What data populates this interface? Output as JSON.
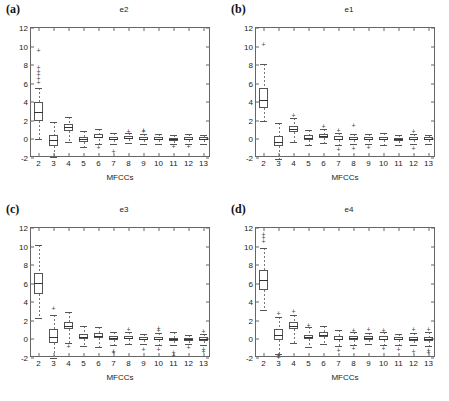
{
  "figure": {
    "xlabel": "MFCCs",
    "yticks": [
      "12",
      "10",
      "8",
      "6",
      "4",
      "2",
      "0",
      "-2"
    ],
    "xticks": [
      "2",
      "3",
      "4",
      "5",
      "6",
      "7",
      "8",
      "9",
      "10",
      "11",
      "12",
      "13"
    ],
    "ylim": [
      -2,
      12
    ],
    "line_color": "#555555",
    "panels": [
      {
        "label": "(a)",
        "title": "e2"
      },
      {
        "label": "(b)",
        "title": "e1"
      },
      {
        "label": "(c)",
        "title": "e3"
      },
      {
        "label": "(d)",
        "title": "e4"
      }
    ]
  },
  "chart_data": [
    {
      "type": "box",
      "title": "e2",
      "panel": "(a)",
      "xlabel": "MFCCs",
      "ylabel": "",
      "ylim": [
        -2,
        12
      ],
      "grid": false,
      "categories": [
        "2",
        "3",
        "4",
        "5",
        "6",
        "7",
        "8",
        "9",
        "10",
        "11",
        "12",
        "13"
      ],
      "boxes": [
        {
          "x": "2",
          "whisker_low": 0.0,
          "q1": 2.0,
          "median": 3.0,
          "q3": 4.0,
          "whisker_high": 5.5,
          "outliers": [
            6.2,
            6.6,
            7.0,
            7.4,
            7.8,
            9.6
          ]
        },
        {
          "x": "3",
          "whisker_low": -1.9,
          "q1": -0.7,
          "median": -0.1,
          "q3": 0.5,
          "whisker_high": 1.9,
          "outliers": []
        },
        {
          "x": "4",
          "whisker_low": -0.3,
          "q1": 0.9,
          "median": 1.3,
          "q3": 1.7,
          "whisker_high": 2.4,
          "outliers": []
        },
        {
          "x": "5",
          "whisker_low": -0.8,
          "q1": -0.3,
          "median": 0.0,
          "q3": 0.3,
          "whisker_high": 0.9,
          "outliers": []
        },
        {
          "x": "6",
          "whisker_low": -0.5,
          "q1": 0.1,
          "median": 0.3,
          "q3": 0.6,
          "whisker_high": 1.1,
          "outliers": [
            -0.8
          ]
        },
        {
          "x": "7",
          "whisker_low": -0.5,
          "q1": -0.1,
          "median": 0.1,
          "q3": 0.3,
          "whisker_high": 0.7,
          "outliers": [
            -1.2
          ]
        },
        {
          "x": "8",
          "whisker_low": -0.4,
          "q1": 0.0,
          "median": 0.2,
          "q3": 0.4,
          "whisker_high": 0.7,
          "outliers": [
            0.95
          ]
        },
        {
          "x": "9",
          "whisker_low": -0.5,
          "q1": -0.1,
          "median": 0.1,
          "q3": 0.3,
          "whisker_high": 0.6,
          "outliers": [
            0.9,
            1.0
          ]
        },
        {
          "x": "10",
          "whisker_low": -0.5,
          "q1": -0.1,
          "median": 0.1,
          "q3": 0.3,
          "whisker_high": 0.6,
          "outliers": []
        },
        {
          "x": "11",
          "whisker_low": -0.5,
          "q1": -0.15,
          "median": 0.0,
          "q3": 0.2,
          "whisker_high": 0.5,
          "outliers": [
            -0.75
          ]
        },
        {
          "x": "12",
          "whisker_low": -0.5,
          "q1": -0.1,
          "median": 0.05,
          "q3": 0.25,
          "whisker_high": 0.55,
          "outliers": [
            -0.7
          ]
        },
        {
          "x": "13",
          "whisker_low": -0.45,
          "q1": -0.1,
          "median": 0.1,
          "q3": 0.25,
          "whisker_high": 0.5,
          "outliers": []
        }
      ]
    },
    {
      "type": "box",
      "title": "e1",
      "panel": "(b)",
      "xlabel": "MFCCs",
      "ylabel": "",
      "ylim": [
        -2,
        12
      ],
      "grid": false,
      "categories": [
        "2",
        "3",
        "4",
        "5",
        "6",
        "7",
        "8",
        "9",
        "10",
        "11",
        "12",
        "13"
      ],
      "boxes": [
        {
          "x": "2",
          "whisker_low": 2.0,
          "q1": 3.4,
          "median": 4.3,
          "q3": 5.5,
          "whisker_high": 8.1,
          "outliers": [
            10.3
          ]
        },
        {
          "x": "3",
          "whisker_low": -2.1,
          "q1": -0.7,
          "median": -0.25,
          "q3": 0.4,
          "whisker_high": 1.8,
          "outliers": []
        },
        {
          "x": "4",
          "whisker_low": -0.3,
          "q1": 0.8,
          "median": 1.1,
          "q3": 1.5,
          "whisker_high": 2.3,
          "outliers": [
            2.6
          ]
        },
        {
          "x": "5",
          "whisker_low": -0.6,
          "q1": -0.1,
          "median": 0.15,
          "q3": 0.45,
          "whisker_high": 1.0,
          "outliers": []
        },
        {
          "x": "6",
          "whisker_low": -0.4,
          "q1": 0.15,
          "median": 0.35,
          "q3": 0.6,
          "whisker_high": 1.1,
          "outliers": [
            1.4
          ]
        },
        {
          "x": "7",
          "whisker_low": -0.55,
          "q1": -0.1,
          "median": 0.1,
          "q3": 0.35,
          "whisker_high": 0.7,
          "outliers": [
            -1.0,
            1.0
          ]
        },
        {
          "x": "8",
          "whisker_low": -0.5,
          "q1": -0.1,
          "median": 0.1,
          "q3": 0.3,
          "whisker_high": 0.6,
          "outliers": [
            -0.9,
            1.6
          ]
        },
        {
          "x": "9",
          "whisker_low": -0.5,
          "q1": -0.1,
          "median": 0.05,
          "q3": 0.25,
          "whisker_high": 0.55,
          "outliers": [
            -0.85
          ]
        },
        {
          "x": "10",
          "whisker_low": -0.55,
          "q1": -0.1,
          "median": 0.1,
          "q3": 0.3,
          "whisker_high": 0.65,
          "outliers": []
        },
        {
          "x": "11",
          "whisker_low": -0.6,
          "q1": -0.15,
          "median": 0.0,
          "q3": 0.2,
          "whisker_high": 0.5,
          "outliers": []
        },
        {
          "x": "12",
          "whisker_low": -0.5,
          "q1": -0.1,
          "median": 0.05,
          "q3": 0.25,
          "whisker_high": 0.55,
          "outliers": [
            -0.9,
            0.95
          ]
        },
        {
          "x": "13",
          "whisker_low": -0.45,
          "q1": -0.1,
          "median": 0.05,
          "q3": 0.25,
          "whisker_high": 0.5,
          "outliers": []
        }
      ]
    },
    {
      "type": "box",
      "title": "e3",
      "panel": "(c)",
      "xlabel": "MFCCs",
      "ylabel": "",
      "ylim": [
        -2,
        12
      ],
      "grid": false,
      "categories": [
        "2",
        "3",
        "4",
        "5",
        "6",
        "7",
        "8",
        "9",
        "10",
        "11",
        "12",
        "13"
      ],
      "boxes": [
        {
          "x": "2",
          "whisker_low": 2.3,
          "q1": 4.9,
          "median": 6.1,
          "q3": 7.2,
          "whisker_high": 10.2,
          "outliers": []
        },
        {
          "x": "3",
          "whisker_low": -2.0,
          "q1": -0.4,
          "median": 0.3,
          "q3": 1.1,
          "whisker_high": 2.6,
          "outliers": [
            3.4
          ]
        },
        {
          "x": "4",
          "whisker_low": -0.4,
          "q1": 1.1,
          "median": 1.5,
          "q3": 1.9,
          "whisker_high": 3.0,
          "outliers": [
            -0.7
          ]
        },
        {
          "x": "5",
          "whisker_low": -0.7,
          "q1": 0.0,
          "median": 0.25,
          "q3": 0.55,
          "whisker_high": 1.4,
          "outliers": []
        },
        {
          "x": "6",
          "whisker_low": -0.8,
          "q1": 0.15,
          "median": 0.4,
          "q3": 0.65,
          "whisker_high": 1.3,
          "outliers": []
        },
        {
          "x": "7",
          "whisker_low": -0.6,
          "q1": -0.05,
          "median": 0.15,
          "q3": 0.35,
          "whisker_high": 0.8,
          "outliers": [
            -1.2,
            -1.4
          ]
        },
        {
          "x": "8",
          "whisker_low": -0.5,
          "q1": 0.0,
          "median": 0.2,
          "q3": 0.4,
          "whisker_high": 0.8,
          "outliers": [
            1.1
          ]
        },
        {
          "x": "9",
          "whisker_low": -0.5,
          "q1": -0.1,
          "median": 0.05,
          "q3": 0.25,
          "whisker_high": 0.6,
          "outliers": [
            -1.0
          ]
        },
        {
          "x": "10",
          "whisker_low": -0.6,
          "q1": -0.1,
          "median": 0.1,
          "q3": 0.3,
          "whisker_high": 0.7,
          "outliers": [
            1.0,
            1.2,
            -1.0
          ]
        },
        {
          "x": "11",
          "whisker_low": -0.6,
          "q1": -0.15,
          "median": 0.0,
          "q3": 0.2,
          "whisker_high": 0.75,
          "outliers": [
            -1.3,
            -1.7
          ]
        },
        {
          "x": "12",
          "whisker_low": -0.5,
          "q1": -0.15,
          "median": 0.0,
          "q3": 0.2,
          "whisker_high": 0.5,
          "outliers": [
            -0.85
          ]
        },
        {
          "x": "13",
          "whisker_low": -0.55,
          "q1": -0.15,
          "median": 0.05,
          "q3": 0.25,
          "whisker_high": 0.6,
          "outliers": [
            0.95,
            -1.0,
            -1.2
          ]
        }
      ]
    },
    {
      "type": "box",
      "title": "e4",
      "panel": "(d)",
      "xlabel": "MFCCs",
      "ylabel": "",
      "ylim": [
        -2,
        12
      ],
      "grid": false,
      "categories": [
        "2",
        "3",
        "4",
        "5",
        "6",
        "7",
        "8",
        "9",
        "10",
        "11",
        "12",
        "13"
      ],
      "boxes": [
        {
          "x": "2",
          "whisker_low": 3.2,
          "q1": 5.3,
          "median": 6.4,
          "q3": 7.5,
          "whisker_high": 9.9,
          "outliers": [
            10.6,
            11.0,
            11.4
          ]
        },
        {
          "x": "3",
          "whisker_low": -1.6,
          "q1": -0.1,
          "median": 0.5,
          "q3": 1.1,
          "whisker_high": 2.4,
          "outliers": [
            2.9,
            -1.9,
            -1.7
          ]
        },
        {
          "x": "4",
          "whisker_low": -0.4,
          "q1": 1.1,
          "median": 1.45,
          "q3": 1.85,
          "whisker_high": 2.6,
          "outliers": [
            3.1
          ]
        },
        {
          "x": "5",
          "whisker_low": -0.8,
          "q1": 0.0,
          "median": 0.25,
          "q3": 0.5,
          "whisker_high": 1.3,
          "outliers": [
            1.6
          ]
        },
        {
          "x": "6",
          "whisker_low": -0.5,
          "q1": 0.25,
          "median": 0.5,
          "q3": 0.75,
          "whisker_high": 1.4,
          "outliers": []
        },
        {
          "x": "7",
          "whisker_low": -0.7,
          "q1": -0.1,
          "median": 0.1,
          "q3": 0.35,
          "whisker_high": 1.0,
          "outliers": [
            -1.1
          ]
        },
        {
          "x": "8",
          "whisker_low": -0.6,
          "q1": -0.05,
          "median": 0.15,
          "q3": 0.35,
          "whisker_high": 0.75,
          "outliers": [
            1.0,
            -0.95
          ]
        },
        {
          "x": "9",
          "whisker_low": -0.5,
          "q1": -0.05,
          "median": 0.15,
          "q3": 0.35,
          "whisker_high": 0.7,
          "outliers": [
            1.1
          ]
        },
        {
          "x": "10",
          "whisker_low": -0.6,
          "q1": -0.1,
          "median": 0.1,
          "q3": 0.35,
          "whisker_high": 0.8,
          "outliers": [
            1.0,
            -0.95
          ]
        },
        {
          "x": "11",
          "whisker_low": -0.55,
          "q1": -0.1,
          "median": 0.1,
          "q3": 0.3,
          "whisker_high": 0.6,
          "outliers": [
            -1.0
          ]
        },
        {
          "x": "12",
          "whisker_low": -0.6,
          "q1": -0.15,
          "median": 0.05,
          "q3": 0.25,
          "whisker_high": 0.65,
          "outliers": [
            1.1,
            -1.2
          ]
        },
        {
          "x": "13",
          "whisker_low": -0.7,
          "q1": -0.15,
          "median": 0.05,
          "q3": 0.3,
          "whisker_high": 0.75,
          "outliers": [
            1.1,
            -1.1,
            -1.4
          ]
        }
      ]
    }
  ]
}
